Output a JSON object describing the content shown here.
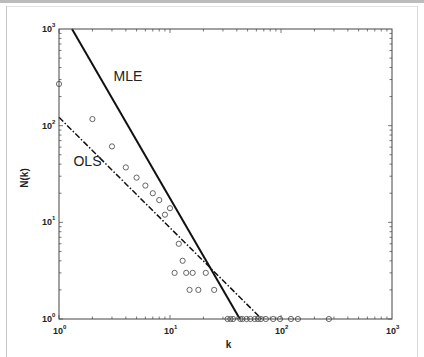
{
  "chart_data": {
    "type": "scatter",
    "title": "",
    "xlabel": "k",
    "ylabel": "N(k)",
    "xscale": "log",
    "yscale": "log",
    "xlim": [
      1,
      1000
    ],
    "ylim": [
      1,
      1000
    ],
    "grid": false,
    "legend": null,
    "x_ticks": [
      {
        "base": "10",
        "exp": "0"
      },
      {
        "base": "10",
        "exp": "1"
      },
      {
        "base": "10",
        "exp": "2"
      },
      {
        "base": "10",
        "exp": "3"
      }
    ],
    "y_ticks": [
      {
        "base": "10",
        "exp": "0"
      },
      {
        "base": "10",
        "exp": "1"
      },
      {
        "base": "10",
        "exp": "2"
      },
      {
        "base": "10",
        "exp": "3"
      }
    ],
    "series": [
      {
        "name": "observed",
        "marker": "circle-open",
        "points": [
          [
            1,
            270
          ],
          [
            2,
            117
          ],
          [
            3,
            61
          ],
          [
            4,
            37
          ],
          [
            5,
            29
          ],
          [
            6,
            24
          ],
          [
            7,
            20
          ],
          [
            8,
            17
          ],
          [
            9,
            12
          ],
          [
            10,
            14
          ],
          [
            11,
            3
          ],
          [
            12,
            6
          ],
          [
            13,
            4
          ],
          [
            14,
            3
          ],
          [
            15,
            2
          ],
          [
            16,
            3
          ],
          [
            18,
            2
          ],
          [
            21,
            3
          ],
          [
            25,
            2
          ],
          [
            33,
            1
          ],
          [
            35,
            1
          ],
          [
            37,
            1
          ],
          [
            43,
            1
          ],
          [
            45,
            1
          ],
          [
            49,
            1
          ],
          [
            53,
            1
          ],
          [
            58,
            1
          ],
          [
            62,
            1
          ],
          [
            66,
            1
          ],
          [
            73,
            1
          ],
          [
            85,
            1
          ],
          [
            98,
            1
          ],
          [
            123,
            1
          ],
          [
            142,
            1
          ],
          [
            270,
            1
          ]
        ]
      },
      {
        "name": "MLE",
        "style": "solid",
        "line": [
          [
            1.31,
            1000
          ],
          [
            42.6,
            1
          ]
        ]
      },
      {
        "name": "OLS",
        "style": "dash-dot",
        "line": [
          [
            1,
            122
          ],
          [
            67,
            1
          ]
        ]
      }
    ],
    "annotations": [
      {
        "text": "MLE",
        "k": 3.1,
        "n": 290
      },
      {
        "text": "OLS",
        "k": 1.35,
        "n": 38
      }
    ]
  }
}
